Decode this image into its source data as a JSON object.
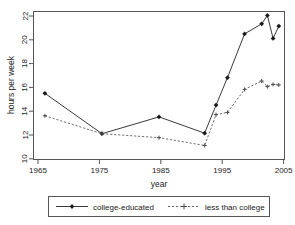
{
  "chart_data": {
    "type": "line",
    "title": "",
    "subtitle": "",
    "xlabel": "year",
    "ylabel": "hours per week",
    "xlim": [
      1963,
      2007
    ],
    "ylim": [
      9.4,
      22.6
    ],
    "xticks": [
      1965,
      1975,
      1985,
      1995,
      2005
    ],
    "xticklabels": [
      "1965",
      "1975",
      "1985",
      "1995",
      "2005"
    ],
    "yticks": [
      10,
      12,
      14,
      16,
      18,
      20,
      22
    ],
    "yticklabels": [
      "10",
      "12",
      "14",
      "16",
      "18",
      "20",
      "22"
    ],
    "grid": false,
    "legend_position": "below",
    "series": [
      {
        "name": "college-educated",
        "linestyle": "solid",
        "marker": "filled-diamond",
        "color": "#3a3a3a",
        "x": [
          1965,
          1975,
          1985,
          1993,
          1995,
          1997,
          2000,
          2003,
          2004,
          2005,
          2006
        ],
        "values": [
          15.3,
          11.7,
          13.2,
          11.75,
          14.25,
          16.7,
          20.6,
          21.5,
          22.25,
          20.2,
          21.3
        ]
      },
      {
        "name": "less than college",
        "linestyle": "dashed",
        "marker": "plus",
        "color": "#6e6e6e",
        "x": [
          1965,
          1975,
          1985,
          1993,
          1995,
          1997,
          2000,
          2003,
          2004,
          2005,
          2006
        ],
        "values": [
          13.3,
          11.7,
          11.35,
          10.65,
          13.4,
          13.6,
          15.65,
          16.4,
          15.9,
          16.1,
          16.05
        ]
      }
    ]
  },
  "legend": {
    "items": [
      {
        "label": "college-educated"
      },
      {
        "label": "less than college"
      }
    ]
  },
  "axes": {
    "x_title": "year",
    "y_title": "hours per week"
  }
}
